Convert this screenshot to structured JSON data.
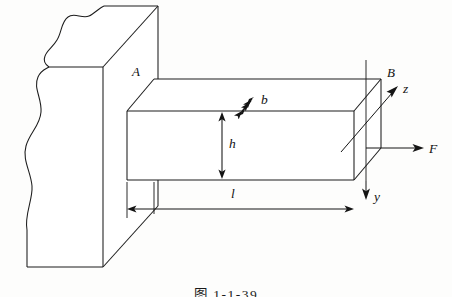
{
  "figure": {
    "type": "engineering-diagram",
    "caption": "图 1-1-39",
    "background_color": "#fdfdfc",
    "line_color": "#1c1c1c"
  },
  "labels": {
    "point_a": "A",
    "point_b": "B",
    "dim_width": "b",
    "dim_height": "h",
    "dim_length": "l",
    "force": "F",
    "axis_y": "y",
    "axis_z": "z"
  },
  "parts": {
    "wall": "wall-support",
    "beam": "cantilever-beam",
    "break_line": "wavy-break-line"
  },
  "annotations": {
    "force_direction": "horizontal-right",
    "axis_y_direction": "down",
    "axis_z_direction": "up-right",
    "dim_b_direction": "diagonal-double-arrow",
    "dim_h_direction": "vertical-double-arrow",
    "dim_l_direction": "horizontal-double-arrow"
  }
}
